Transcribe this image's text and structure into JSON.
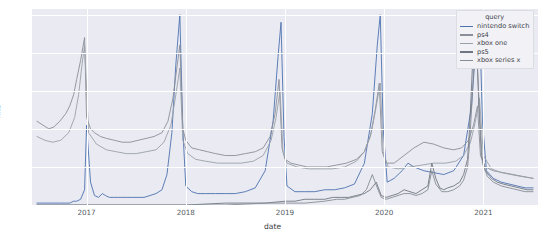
{
  "chart_data": {
    "type": "line",
    "title": "",
    "xlabel": "date",
    "ylabel": "hits",
    "xlim": [
      2016.45,
      2021.55
    ],
    "ylim": [
      0,
      103
    ],
    "grid": true,
    "legend_position": "upper right",
    "legend_title": "query",
    "xticks": [
      "2017",
      "2018",
      "2019",
      "2020",
      "2021"
    ],
    "xtick_values": [
      2017,
      2018,
      2019,
      2020,
      2021
    ],
    "yticks": [
      "0",
      "20",
      "40",
      "60",
      "80",
      "100"
    ],
    "ytick_values": [
      0,
      20,
      40,
      60,
      80,
      100
    ],
    "colors": {
      "nintendo_switch": "#4c72b0",
      "ps4": "#8a8f99",
      "xbox_one": "#9aa0a8",
      "ps5": "#6f7681",
      "xbox_series_x": "#868c95",
      "plot_background": "#eaeaf2",
      "grid": "#ffffff",
      "figure_background": "#ffffff"
    },
    "series": [
      {
        "name": "nintendo switch",
        "color": "#4c72b0",
        "x": [
          2016.5,
          2016.56,
          2016.62,
          2016.67,
          2016.73,
          2016.79,
          2016.83,
          2016.87,
          2016.9,
          2016.94,
          2016.98,
          2017.0,
          2017.04,
          2017.08,
          2017.12,
          2017.16,
          2017.19,
          2017.23,
          2017.27,
          2017.31,
          2017.35,
          2017.4,
          2017.46,
          2017.52,
          2017.58,
          2017.64,
          2017.7,
          2017.76,
          2017.81,
          2017.86,
          2017.9,
          2017.94,
          2017.97,
          2018.0,
          2018.06,
          2018.12,
          2018.2,
          2018.3,
          2018.4,
          2018.5,
          2018.6,
          2018.7,
          2018.8,
          2018.88,
          2018.93,
          2018.96,
          2018.99,
          2019.02,
          2019.1,
          2019.2,
          2019.3,
          2019.4,
          2019.5,
          2019.6,
          2019.7,
          2019.8,
          2019.88,
          2019.93,
          2019.96,
          2019.99,
          2020.03,
          2020.1,
          2020.18,
          2020.24,
          2020.3,
          2020.4,
          2020.5,
          2020.6,
          2020.7,
          2020.8,
          2020.88,
          2020.93,
          2020.96,
          2020.99,
          2021.03,
          2021.1,
          2021.18,
          2021.26,
          2021.34,
          2021.42,
          2021.5
        ],
        "y": [
          1,
          1,
          1,
          1,
          1,
          1,
          1,
          2,
          2,
          3,
          8,
          42,
          12,
          5,
          4,
          6,
          5,
          4,
          4,
          4,
          4,
          4,
          4,
          4,
          4,
          5,
          6,
          8,
          16,
          38,
          74,
          100,
          40,
          10,
          7,
          6,
          6,
          6,
          6,
          6,
          7,
          9,
          18,
          44,
          78,
          96,
          36,
          10,
          7,
          7,
          7,
          8,
          8,
          9,
          11,
          22,
          48,
          84,
          100,
          40,
          12,
          14,
          18,
          22,
          20,
          18,
          17,
          16,
          18,
          26,
          52,
          88,
          100,
          44,
          18,
          14,
          12,
          11,
          10,
          9,
          9
        ]
      },
      {
        "name": "ps4",
        "color": "#8a8f99",
        "x": [
          2016.5,
          2016.56,
          2016.62,
          2016.67,
          2016.73,
          2016.79,
          2016.83,
          2016.87,
          2016.9,
          2016.94,
          2016.98,
          2017.0,
          2017.04,
          2017.08,
          2017.14,
          2017.2,
          2017.28,
          2017.36,
          2017.44,
          2017.52,
          2017.6,
          2017.68,
          2017.76,
          2017.82,
          2017.87,
          2017.91,
          2017.94,
          2017.97,
          2018.0,
          2018.06,
          2018.14,
          2018.22,
          2018.3,
          2018.4,
          2018.5,
          2018.6,
          2018.7,
          2018.78,
          2018.85,
          2018.9,
          2018.94,
          2018.97,
          2019.0,
          2019.06,
          2019.14,
          2019.22,
          2019.32,
          2019.42,
          2019.52,
          2019.62,
          2019.72,
          2019.8,
          2019.86,
          2019.91,
          2019.95,
          2019.98,
          2020.02,
          2020.1,
          2020.2,
          2020.3,
          2020.4,
          2020.5,
          2020.6,
          2020.7,
          2020.78,
          2020.85,
          2020.9,
          2020.94,
          2020.97,
          2021.02,
          2021.1,
          2021.2,
          2021.3,
          2021.4,
          2021.5
        ],
        "y": [
          44,
          42,
          40,
          41,
          44,
          48,
          52,
          58,
          66,
          76,
          88,
          46,
          40,
          38,
          36,
          35,
          34,
          33,
          33,
          34,
          35,
          36,
          38,
          44,
          56,
          72,
          84,
          40,
          34,
          30,
          29,
          28,
          27,
          26,
          26,
          27,
          28,
          30,
          36,
          48,
          66,
          30,
          24,
          22,
          21,
          20,
          20,
          20,
          21,
          22,
          24,
          28,
          36,
          50,
          64,
          28,
          22,
          22,
          26,
          30,
          33,
          32,
          30,
          29,
          30,
          34,
          42,
          52,
          26,
          20,
          18,
          17,
          16,
          15,
          14
        ]
      },
      {
        "name": "xbox one",
        "color": "#9aa0a8",
        "x": [
          2016.5,
          2016.58,
          2016.66,
          2016.74,
          2016.82,
          2016.88,
          2016.92,
          2016.95,
          2016.98,
          2017.02,
          2017.1,
          2017.2,
          2017.3,
          2017.4,
          2017.5,
          2017.6,
          2017.7,
          2017.78,
          2017.85,
          2017.9,
          2017.94,
          2017.97,
          2018.02,
          2018.1,
          2018.2,
          2018.32,
          2018.44,
          2018.56,
          2018.68,
          2018.78,
          2018.86,
          2018.91,
          2018.95,
          2018.98,
          2019.02,
          2019.12,
          2019.24,
          2019.36,
          2019.48,
          2019.6,
          2019.72,
          2019.8,
          2019.87,
          2019.92,
          2019.96,
          2019.99,
          2020.04,
          2020.14,
          2020.26,
          2020.38,
          2020.5,
          2020.62,
          2020.72,
          2020.8,
          2020.87,
          2020.92,
          2020.96,
          2021.0,
          2021.08,
          2021.18,
          2021.28,
          2021.38,
          2021.5
        ],
        "y": [
          36,
          34,
          33,
          34,
          38,
          46,
          58,
          72,
          84,
          38,
          32,
          29,
          28,
          27,
          27,
          28,
          29,
          33,
          42,
          58,
          72,
          34,
          27,
          24,
          23,
          22,
          22,
          22,
          23,
          26,
          34,
          46,
          60,
          28,
          22,
          20,
          19,
          19,
          19,
          20,
          23,
          28,
          38,
          52,
          64,
          28,
          20,
          19,
          20,
          21,
          22,
          22,
          23,
          26,
          33,
          44,
          56,
          26,
          19,
          17,
          16,
          15,
          14
        ]
      },
      {
        "name": "ps5",
        "color": "#6f7681",
        "x": [
          2016.5,
          2017.0,
          2017.5,
          2018.0,
          2018.4,
          2018.8,
          2019.0,
          2019.1,
          2019.2,
          2019.3,
          2019.4,
          2019.48,
          2019.56,
          2019.64,
          2019.72,
          2019.8,
          2019.86,
          2019.92,
          2019.97,
          2020.02,
          2020.08,
          2020.14,
          2020.2,
          2020.26,
          2020.32,
          2020.38,
          2020.44,
          2020.48,
          2020.52,
          2020.56,
          2020.6,
          2020.64,
          2020.7,
          2020.76,
          2020.8,
          2020.84,
          2020.86,
          2020.88,
          2020.9,
          2020.92,
          2020.94,
          2020.96,
          2020.98,
          2021.02,
          2021.08,
          2021.14,
          2021.2,
          2021.28,
          2021.36,
          2021.44,
          2021.5
        ],
        "y": [
          0,
          0,
          0,
          0,
          1,
          1,
          2,
          2,
          3,
          3,
          3,
          4,
          4,
          4,
          5,
          6,
          8,
          12,
          5,
          4,
          5,
          6,
          8,
          7,
          6,
          8,
          10,
          22,
          14,
          9,
          8,
          9,
          10,
          12,
          16,
          24,
          40,
          62,
          86,
          100,
          72,
          46,
          26,
          18,
          14,
          12,
          11,
          10,
          9,
          8,
          8
        ]
      },
      {
        "name": "xbox series x",
        "color": "#868c95",
        "x": [
          2016.5,
          2017.0,
          2017.5,
          2018.0,
          2018.4,
          2018.8,
          2019.0,
          2019.2,
          2019.4,
          2019.52,
          2019.6,
          2019.68,
          2019.76,
          2019.82,
          2019.88,
          2019.93,
          2019.97,
          2020.02,
          2020.08,
          2020.14,
          2020.2,
          2020.26,
          2020.32,
          2020.38,
          2020.44,
          2020.48,
          2020.52,
          2020.58,
          2020.64,
          2020.7,
          2020.76,
          2020.8,
          2020.84,
          2020.86,
          2020.88,
          2020.9,
          2020.92,
          2020.94,
          2020.96,
          2020.99,
          2021.04,
          2021.1,
          2021.18,
          2021.26,
          2021.34,
          2021.42,
          2021.5
        ],
        "y": [
          0,
          0,
          0,
          0,
          0,
          1,
          1,
          1,
          2,
          3,
          3,
          4,
          5,
          8,
          16,
          9,
          4,
          3,
          4,
          5,
          6,
          6,
          5,
          6,
          8,
          18,
          11,
          7,
          7,
          8,
          10,
          13,
          20,
          32,
          50,
          70,
          84,
          72,
          48,
          22,
          15,
          12,
          10,
          9,
          8,
          7,
          7
        ]
      }
    ]
  },
  "axis": {
    "ylabel": "hits",
    "xlabel": "date"
  }
}
